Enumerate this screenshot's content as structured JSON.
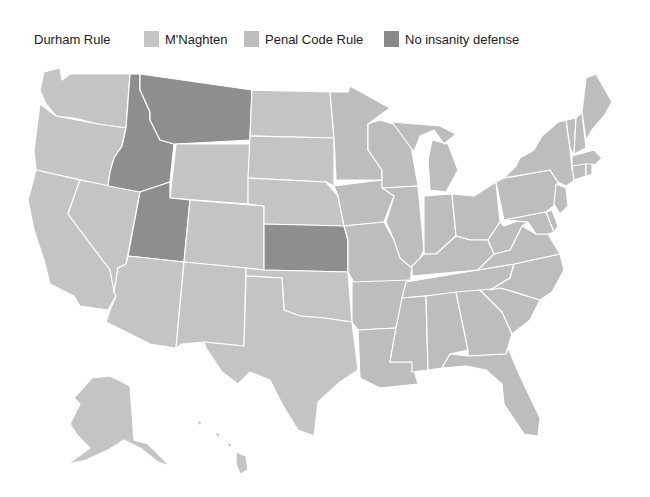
{
  "legend": {
    "items": [
      {
        "label": "Durham Rule",
        "color": null,
        "x": 0
      },
      {
        "label": "M'Naghten",
        "color": "#c4c4c4",
        "x": 110
      },
      {
        "label": "Penal Code Rule",
        "color": "#bdbdbd",
        "x": 210
      },
      {
        "label": "No insanity defense",
        "color": "#8a8a8a",
        "x": 350
      }
    ]
  },
  "colors": {
    "mnaghten": "#c4c4c4",
    "penal_code": "#bdbdbd",
    "none": "#8e8e8e",
    "border": "#ffffff"
  },
  "chart_data": {
    "type": "choropleth",
    "title": "",
    "legend": [
      "Durham Rule",
      "M'Naghten",
      "Penal Code Rule",
      "No insanity defense"
    ],
    "categories": {
      "No insanity defense": [
        "Idaho",
        "Montana",
        "Utah",
        "Kansas"
      ],
      "M'Naghten / Penal Code Rule (light gray)": [
        "All other states including Alaska and Hawaii"
      ]
    }
  },
  "states": [
    {
      "name": "WA",
      "cat": "mnaghten",
      "d": "M44,72 L60,68 L62,80 L70,74 L130,74 L126,128 L98,124 L74,118 L56,116 L46,104 L40,90 Z"
    },
    {
      "name": "OR",
      "cat": "mnaghten",
      "d": "M40,104 L56,116 L98,124 L126,128 L122,146 L114,158 L110,172 L108,186 L36,170 L34,150 Z"
    },
    {
      "name": "CA",
      "cat": "mnaghten",
      "d": "M36,170 L80,180 L68,214 L110,270 L116,296 L108,310 L80,306 L74,296 L50,284 L44,260 L34,230 L28,200 Z"
    },
    {
      "name": "NV",
      "cat": "mnaghten",
      "d": "M80,180 L140,192 L126,264 L118,268 L114,292 L110,270 L68,214 Z"
    },
    {
      "name": "ID",
      "cat": "none",
      "d": "M130,74 L140,74 L140,90 L150,112 L150,120 L160,140 L174,144 L170,182 L140,192 L108,186 L110,172 L114,158 L122,146 L126,128 Z"
    },
    {
      "name": "MT",
      "cat": "none",
      "d": "M140,74 L252,90 L250,140 L176,144 L174,144 L160,140 L150,120 L150,112 L140,90 Z"
    },
    {
      "name": "WY",
      "cat": "mnaghten",
      "d": "M176,144 L250,144 L248,204 L170,198 Z"
    },
    {
      "name": "UT",
      "cat": "none",
      "d": "M140,192 L170,182 L170,198 L190,200 L184,262 L128,256 Z"
    },
    {
      "name": "AZ",
      "cat": "mnaghten",
      "d": "M128,256 L184,262 L176,348 L150,344 L106,322 L110,310 L116,296 L114,292 L118,268 L126,264 Z"
    },
    {
      "name": "CO",
      "cat": "mnaghten",
      "d": "M190,200 L264,206 L264,270 L184,262 Z"
    },
    {
      "name": "NM",
      "cat": "mnaghten",
      "d": "M184,262 L246,268 L244,346 L204,342 L182,344 L176,348 Z"
    },
    {
      "name": "ND",
      "cat": "mnaghten",
      "d": "M252,90 L330,92 L334,138 L250,136 Z"
    },
    {
      "name": "SD",
      "cat": "mnaghten",
      "d": "M250,136 L334,138 L334,186 L326,182 L248,178 Z"
    },
    {
      "name": "NE",
      "cat": "mnaghten",
      "d": "M248,178 L326,182 L338,196 L344,226 L264,224 L264,206 L248,204 Z"
    },
    {
      "name": "KS",
      "cat": "none",
      "d": "M264,224 L344,226 L348,240 L348,272 L264,270 Z"
    },
    {
      "name": "OK",
      "cat": "mnaghten",
      "d": "M246,268 L264,270 L348,272 L352,322 L324,318 L300,316 L284,310 L282,278 L246,276 Z"
    },
    {
      "name": "TX",
      "cat": "mnaghten",
      "d": "M246,276 L282,278 L284,310 L300,316 L324,318 L352,322 L358,370 L340,382 L318,402 L314,436 L298,430 L282,404 L270,380 L250,372 L238,384 L222,372 L206,348 L204,342 L244,346 Z"
    },
    {
      "name": "MN",
      "cat": "penal_code",
      "d": "M330,92 L348,92 L350,86 L390,108 L368,124 L368,150 L382,170 L382,180 L336,180 L334,138 Z"
    },
    {
      "name": "IA",
      "cat": "penal_code",
      "d": "M334,186 L382,180 L394,196 L384,222 L344,226 L338,196 Z"
    },
    {
      "name": "MO",
      "cat": "penal_code",
      "d": "M344,226 L384,222 L394,240 L412,266 L410,284 L356,286 L348,272 L348,240 Z"
    },
    {
      "name": "AR",
      "cat": "penal_code",
      "d": "M352,282 L410,280 L404,296 L396,328 L358,330 L352,322 Z"
    },
    {
      "name": "LA",
      "cat": "penal_code",
      "d": "M358,330 L396,328 L390,362 L412,362 L418,384 L380,388 L360,378 Z"
    },
    {
      "name": "WI",
      "cat": "penal_code",
      "d": "M368,124 L380,120 L400,126 L410,140 L418,186 L382,188 L382,170 L368,150 Z"
    },
    {
      "name": "IL",
      "cat": "penal_code",
      "d": "M382,188 L418,186 L424,250 L414,270 L400,258 L394,240 L386,222 L394,196 Z"
    },
    {
      "name": "MI",
      "cat": "penal_code",
      "d": "M392,122 L440,126 L456,134 L444,144 L434,130 L420,136 L414,152 Z M432,140 L448,144 L458,170 L446,192 L430,190 L428,160 Z"
    },
    {
      "name": "IN",
      "cat": "penal_code",
      "d": "M424,196 L452,194 L456,236 L436,254 L424,254 Z"
    },
    {
      "name": "OH",
      "cat": "penal_code",
      "d": "M452,194 L474,196 L496,182 L500,222 L488,240 L470,240 L456,236 Z"
    },
    {
      "name": "KY",
      "cat": "penal_code",
      "d": "M412,266 L424,254 L436,254 L456,236 L470,240 L488,240 L494,254 L478,270 L412,276 Z"
    },
    {
      "name": "TN",
      "cat": "penal_code",
      "d": "M406,282 L478,270 L514,264 L510,278 L490,290 L402,298 Z"
    },
    {
      "name": "MS",
      "cat": "penal_code",
      "d": "M402,298 L426,296 L428,370 L412,372 L412,362 L390,362 L396,328 Z"
    },
    {
      "name": "AL",
      "cat": "penal_code",
      "d": "M426,296 L456,292 L468,350 L450,354 L442,368 L428,370 Z"
    },
    {
      "name": "GA",
      "cat": "penal_code",
      "d": "M456,292 L480,290 L502,312 L512,334 L506,354 L468,356 L468,350 Z"
    },
    {
      "name": "FL",
      "cat": "penal_code",
      "d": "M442,368 L450,354 L468,356 L506,354 L508,348 L520,376 L540,418 L538,436 L524,434 L504,404 L502,384 L486,370 L466,366 Z"
    },
    {
      "name": "SC",
      "cat": "penal_code",
      "d": "M480,290 L500,288 L508,290 L540,300 L530,320 L512,334 L502,312 Z"
    },
    {
      "name": "NC",
      "cat": "penal_code",
      "d": "M490,290 L510,278 L514,264 L560,254 L564,270 L552,292 L540,300 L508,290 L500,288 Z"
    },
    {
      "name": "VA",
      "cat": "penal_code",
      "d": "M478,270 L494,254 L510,250 L522,226 L536,234 L548,234 L560,254 L514,264 Z"
    },
    {
      "name": "WV",
      "cat": "penal_code",
      "d": "M488,240 L500,222 L504,226 L520,220 L528,222 L522,226 L510,250 L494,254 Z"
    },
    {
      "name": "PA",
      "cat": "penal_code",
      "d": "M496,182 L504,178 L550,170 L558,182 L556,204 L546,212 L504,220 Z"
    },
    {
      "name": "MD",
      "cat": "penal_code",
      "d": "M504,220 L546,212 L554,232 L548,234 L536,234 L528,222 Z"
    },
    {
      "name": "DE",
      "cat": "penal_code",
      "d": "M546,212 L552,210 L558,226 L554,232 Z"
    },
    {
      "name": "NJ",
      "cat": "penal_code",
      "d": "M556,184 L566,188 L568,206 L560,214 L554,204 Z"
    },
    {
      "name": "NY",
      "cat": "penal_code",
      "d": "M504,178 L516,166 L520,158 L534,150 L542,136 L558,122 L566,120 L570,148 L572,170 L578,178 L566,186 L558,182 L550,170 Z"
    },
    {
      "name": "VT",
      "cat": "penal_code",
      "d": "M558,122 L576,118 L574,156 L570,148 L566,120 Z"
    },
    {
      "name": "NH",
      "cat": "penal_code",
      "d": "M576,118 L582,112 L586,148 L574,154 Z"
    },
    {
      "name": "ME",
      "cat": "penal_code",
      "d": "M582,112 L586,78 L596,74 L612,102 L604,116 L592,130 L586,140 Z"
    },
    {
      "name": "MA",
      "cat": "penal_code",
      "d": "M572,156 L594,150 L602,158 L596,164 L572,166 Z"
    },
    {
      "name": "CT",
      "cat": "penal_code",
      "d": "M572,166 L586,164 L586,176 L574,180 Z"
    },
    {
      "name": "RI",
      "cat": "penal_code",
      "d": "M586,164 L592,164 L592,174 L586,176 Z"
    },
    {
      "name": "AK",
      "cat": "mnaghten",
      "d": "M92,378 L110,376 L130,386 L134,440 L148,444 L170,466 L158,462 L140,448 L124,440 L108,450 L86,460 L68,464 L90,448 L78,436 L70,424 L80,404 L74,398 Z"
    },
    {
      "name": "HI",
      "cat": "mnaghten",
      "d": "M236,452 L246,456 L248,470 L240,474 L236,464 Z M226,442 L232,444 L230,448 Z M214,432 L220,434 L218,438 Z M196,420 L202,422 L200,426 Z"
    }
  ]
}
